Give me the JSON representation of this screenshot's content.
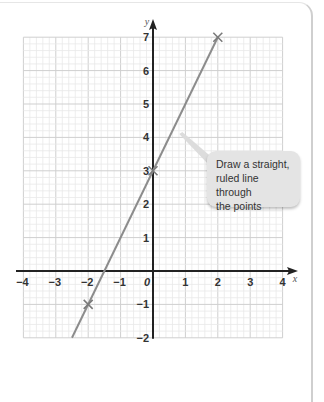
{
  "chart_data": {
    "type": "line",
    "title": "",
    "xlabel": "x",
    "ylabel": "y",
    "xlim": [
      -4,
      4
    ],
    "ylim": [
      -2,
      7
    ],
    "x_ticks": [
      "−4",
      "−3",
      "−2",
      "−1",
      "0",
      "1",
      "2",
      "3",
      "4"
    ],
    "y_ticks": [
      "−2",
      "−1",
      "1",
      "2",
      "3",
      "4",
      "5",
      "6",
      "7"
    ],
    "grid": true,
    "grid_minor_per_unit": 5,
    "series": [
      {
        "name": "y = 2x + 3",
        "equation": "y = 2x + 3",
        "line_from": [
          -2.5,
          -2
        ],
        "line_to": [
          2,
          7
        ],
        "marked_points": [
          [
            -2,
            -1
          ],
          [
            0,
            3
          ],
          [
            2,
            7
          ]
        ],
        "color": "#8c8c8c"
      }
    ],
    "annotations": [
      {
        "text": "Draw a straight, ruled line through the points",
        "points_to": [
          0.75,
          4.1
        ]
      }
    ]
  },
  "callout": {
    "lines": [
      "Draw a straight,",
      "ruled line through",
      "the points"
    ]
  },
  "colors": {
    "axis": "#222222",
    "line": "#8c8c8c",
    "grid_major": "#cfcfcf",
    "grid_minor": "#e8e8e8",
    "callout_bg": "#e4e4e4"
  }
}
